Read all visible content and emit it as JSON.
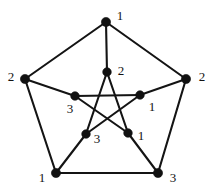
{
  "figure": {
    "background_color": "#ffffff",
    "edge_color": "#141414",
    "node_color": "#111111",
    "label_color": "#121212",
    "width": 217,
    "height": 192
  },
  "chart_data": {
    "type": "diagram",
    "diagram_type": "graph",
    "title": "",
    "xlabel": "",
    "ylabel": "",
    "color_palette": [
      "1",
      "2",
      "3"
    ],
    "nodes": [
      {
        "id": "o1",
        "label": "1",
        "ring": "outer",
        "x": 106,
        "y": 22,
        "label_x": 120,
        "label_y": 15,
        "node_radius": 4.6
      },
      {
        "id": "o2",
        "label": "2",
        "ring": "outer",
        "x": 186,
        "y": 79,
        "label_x": 202,
        "label_y": 76,
        "node_radius": 4.6
      },
      {
        "id": "o3",
        "label": "3",
        "ring": "outer",
        "x": 158,
        "y": 173,
        "label_x": 173,
        "label_y": 177,
        "node_radius": 4.6
      },
      {
        "id": "o4",
        "label": "1",
        "ring": "outer",
        "x": 56,
        "y": 173,
        "label_x": 42,
        "label_y": 177,
        "node_radius": 4.6
      },
      {
        "id": "o5",
        "label": "2",
        "ring": "outer",
        "x": 25,
        "y": 79,
        "label_x": 11,
        "label_y": 76,
        "node_radius": 4.6
      },
      {
        "id": "i1",
        "label": "2",
        "ring": "inner",
        "x": 107,
        "y": 72,
        "label_x": 121,
        "label_y": 70,
        "node_radius": 4.3
      },
      {
        "id": "i2",
        "label": "1",
        "ring": "inner",
        "x": 140,
        "y": 95,
        "label_x": 152,
        "label_y": 106,
        "node_radius": 4.3
      },
      {
        "id": "i3",
        "label": "1",
        "ring": "inner",
        "x": 128,
        "y": 133,
        "label_x": 141,
        "label_y": 135,
        "node_radius": 4.3
      },
      {
        "id": "i4",
        "label": "3",
        "ring": "inner",
        "x": 86,
        "y": 134,
        "label_x": 97,
        "label_y": 138,
        "node_radius": 4.3
      },
      {
        "id": "i5",
        "label": "3",
        "ring": "inner",
        "x": 75,
        "y": 96,
        "label_x": 70,
        "label_y": 108,
        "node_radius": 4.3
      }
    ],
    "edges": [
      {
        "from": "o1",
        "to": "o2",
        "group": "outer-cycle"
      },
      {
        "from": "o2",
        "to": "o3",
        "group": "outer-cycle"
      },
      {
        "from": "o3",
        "to": "o4",
        "group": "outer-cycle"
      },
      {
        "from": "o4",
        "to": "o5",
        "group": "outer-cycle"
      },
      {
        "from": "o5",
        "to": "o1",
        "group": "outer-cycle"
      },
      {
        "from": "o1",
        "to": "i1",
        "group": "spoke"
      },
      {
        "from": "o2",
        "to": "i2",
        "group": "spoke"
      },
      {
        "from": "o3",
        "to": "i3",
        "group": "spoke"
      },
      {
        "from": "o4",
        "to": "i4",
        "group": "spoke"
      },
      {
        "from": "o5",
        "to": "i5",
        "group": "spoke"
      },
      {
        "from": "i1",
        "to": "i3",
        "group": "inner-pentagram"
      },
      {
        "from": "i3",
        "to": "i5",
        "group": "inner-pentagram"
      },
      {
        "from": "i5",
        "to": "i2",
        "group": "inner-pentagram"
      },
      {
        "from": "i2",
        "to": "i4",
        "group": "inner-pentagram"
      },
      {
        "from": "i4",
        "to": "i1",
        "group": "inner-pentagram"
      }
    ],
    "node_count": 10,
    "edge_count": 15,
    "legend": []
  }
}
